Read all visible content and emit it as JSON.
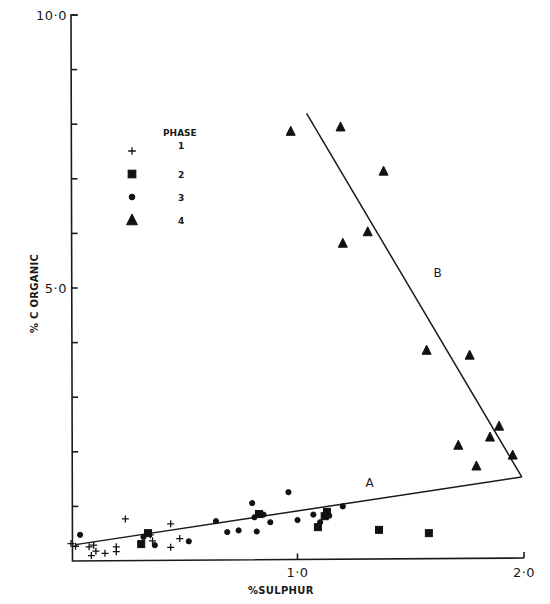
{
  "chart_data": {
    "type": "scatter",
    "title": "",
    "xlabel": "% SULPHUR",
    "ylabel": "% C ORGANIC",
    "xlim": [
      0,
      2.0
    ],
    "ylim": [
      0,
      10.0
    ],
    "x_tick_labels": [
      "1·0",
      "2·0"
    ],
    "x_ticks": [
      1.0,
      2.0
    ],
    "y_tick_labels": [
      "5·0",
      "10·0"
    ],
    "y_ticks_labeled": [
      5.0,
      10.0
    ],
    "y_ticks_minor": [
      1,
      2,
      3,
      4,
      6,
      7,
      8,
      9
    ],
    "grid": false,
    "legend": {
      "title": "PHASE",
      "position": "upper-left",
      "entries": [
        {
          "label": "1",
          "marker": "plus"
        },
        {
          "label": "2",
          "marker": "square"
        },
        {
          "label": "3",
          "marker": "circle"
        },
        {
          "label": "4",
          "marker": "triangle"
        }
      ]
    },
    "lines": [
      {
        "name": "A",
        "x": [
          0.02,
          1.99
        ],
        "y": [
          0.3,
          1.54
        ]
      },
      {
        "name": "B",
        "x": [
          1.04,
          1.99
        ],
        "y": [
          8.2,
          1.54
        ]
      }
    ],
    "series": [
      {
        "name": "Phase 1",
        "marker": "plus",
        "x": [
          0.0,
          0.02,
          0.08,
          0.09,
          0.1,
          0.11,
          0.15,
          0.2,
          0.2,
          0.24,
          0.35,
          0.36,
          0.44,
          0.44,
          0.48
        ],
        "y": [
          0.32,
          0.27,
          0.26,
          0.1,
          0.29,
          0.18,
          0.14,
          0.17,
          0.26,
          0.77,
          0.48,
          0.37,
          0.68,
          0.25,
          0.41
        ]
      },
      {
        "name": "Phase 2",
        "marker": "square",
        "x": [
          0.31,
          0.34,
          0.83,
          1.09,
          1.12,
          1.13,
          1.36,
          1.58
        ],
        "y": [
          0.31,
          0.51,
          0.86,
          0.62,
          0.82,
          0.9,
          0.57,
          0.51
        ]
      },
      {
        "name": "Phase 3",
        "marker": "circle",
        "x": [
          0.04,
          0.32,
          0.37,
          0.52,
          0.64,
          0.69,
          0.74,
          0.8,
          0.81,
          0.82,
          0.85,
          0.88,
          0.96,
          1.0,
          1.07,
          1.1,
          1.14,
          1.2
        ],
        "y": [
          0.48,
          0.44,
          0.29,
          0.36,
          0.73,
          0.53,
          0.56,
          1.06,
          0.8,
          0.54,
          0.85,
          0.71,
          1.26,
          0.75,
          0.85,
          0.71,
          0.83,
          1.0
        ]
      },
      {
        "name": "Phase 4",
        "marker": "triangle",
        "x": [
          0.97,
          1.19,
          1.38,
          1.2,
          1.31,
          1.57,
          1.76,
          1.71,
          1.85,
          1.89,
          1.79,
          1.95
        ],
        "y": [
          7.87,
          7.95,
          7.14,
          5.82,
          6.03,
          3.86,
          3.77,
          2.12,
          2.27,
          2.47,
          1.74,
          1.94
        ]
      }
    ],
    "annotations": [
      {
        "text": "A",
        "x": 1.3,
        "y": 1.35
      },
      {
        "text": "B",
        "x": 1.6,
        "y": 5.2
      }
    ]
  }
}
